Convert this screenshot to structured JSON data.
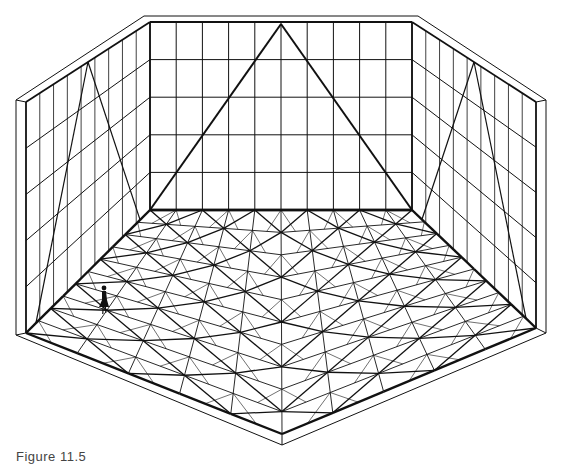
{
  "figure": {
    "caption": "Figure 11.5",
    "colors": {
      "line": "#111111",
      "background": "#ffffff"
    },
    "back_wall": {
      "top_left": [
        150,
        22
      ],
      "top_right": [
        412,
        22
      ],
      "bottom_left": [
        150,
        210
      ],
      "bottom_right": [
        412,
        210
      ],
      "columns": 10,
      "rows": 5,
      "triangle_apex": [
        281,
        24
      ]
    },
    "left_wall": {
      "top_far": [
        150,
        22
      ],
      "top_near": [
        26,
        102
      ],
      "bottom_far": [
        150,
        210
      ],
      "bottom_near": [
        26,
        333
      ],
      "columns": 9,
      "rows": 5,
      "rim_offset": 10
    },
    "right_wall": {
      "top_far": [
        412,
        22
      ],
      "top_near": [
        536,
        102
      ],
      "bottom_far": [
        412,
        210
      ],
      "bottom_near": [
        536,
        328
      ],
      "columns": 9,
      "rows": 5,
      "rim_offset": 10
    },
    "floor": {
      "back_left": [
        150,
        210
      ],
      "back_right": [
        412,
        210
      ],
      "right": [
        536,
        328
      ],
      "front": [
        282,
        434
      ],
      "left": [
        26,
        333
      ],
      "divisions": 10,
      "rim": {
        "left": [
          16,
          335
        ],
        "front": [
          282,
          445
        ],
        "right": [
          546,
          333
        ]
      }
    },
    "human_figure": {
      "position": [
        104,
        298
      ],
      "label": "scale figure"
    }
  }
}
